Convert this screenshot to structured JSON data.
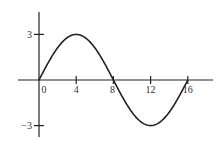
{
  "chart_data": {
    "type": "line",
    "title": "",
    "xlabel": "",
    "ylabel": "",
    "function": "y = 3 sin(pi x / 8)",
    "x_ticks": [
      0,
      4,
      8,
      12,
      16
    ],
    "x_tick_labels": [
      "0",
      "4",
      "8",
      "12",
      "16"
    ],
    "y_ticks": [
      3,
      -3
    ],
    "y_tick_labels": [
      "3",
      "−3"
    ],
    "xlim": [
      -2.3,
      18.6
    ],
    "ylim": [
      -3.7,
      4.5
    ],
    "grid": false,
    "legend": null,
    "series": [
      {
        "name": "sine wave",
        "x": [
          0,
          1,
          2,
          3,
          4,
          5,
          6,
          7,
          8,
          9,
          10,
          11,
          12,
          13,
          14,
          15,
          16
        ],
        "values": [
          0,
          1.15,
          2.12,
          2.77,
          3,
          2.77,
          2.12,
          1.15,
          0,
          -1.15,
          -2.12,
          -2.77,
          -3,
          -2.77,
          -2.12,
          -1.15,
          0
        ]
      }
    ],
    "colors": {
      "axis": "#222222",
      "curve": "#222222",
      "background": "#ffffff"
    }
  }
}
